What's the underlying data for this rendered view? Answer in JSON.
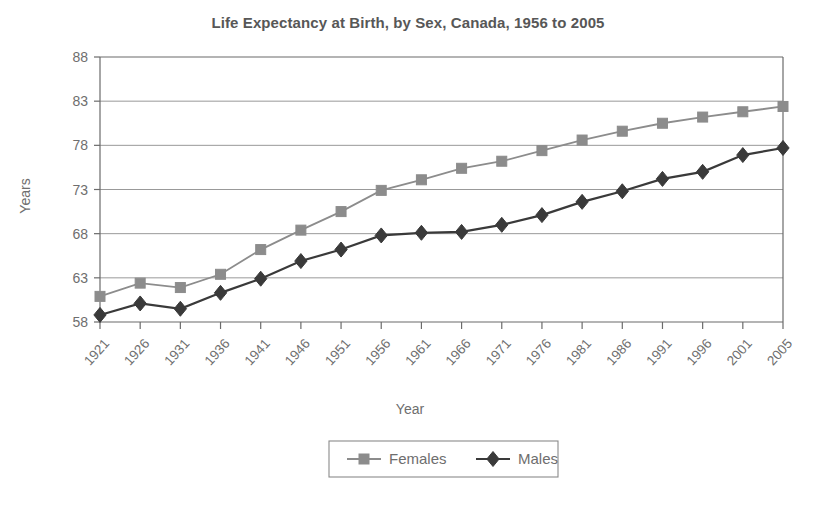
{
  "chart_data": {
    "type": "line",
    "title": "Life Expectancy at Birth, by Sex, Canada, 1956 to 2005",
    "xlabel": "Year",
    "ylabel": "Years",
    "categories": [
      "1921",
      "1926",
      "1931",
      "1936",
      "1941",
      "1946",
      "1951",
      "1956",
      "1961",
      "1966",
      "1971",
      "1976",
      "1981",
      "1986",
      "1991",
      "1996",
      "2001",
      "2005"
    ],
    "yticks": [
      58,
      63,
      68,
      73,
      78,
      83,
      88
    ],
    "ylim": [
      58,
      88
    ],
    "grid": "horizontal",
    "legend_position": "bottom",
    "series": [
      {
        "name": "Females",
        "marker": "square",
        "color": "#8c8c8c",
        "values": [
          60.9,
          62.4,
          61.9,
          63.4,
          66.2,
          68.4,
          70.5,
          72.9,
          74.1,
          75.4,
          76.2,
          77.4,
          78.6,
          79.6,
          80.5,
          81.2,
          81.8,
          82.4
        ]
      },
      {
        "name": "Males",
        "marker": "diamond",
        "color": "#3a3a3a",
        "values": [
          58.8,
          60.1,
          59.5,
          61.3,
          62.9,
          64.9,
          66.2,
          67.8,
          68.1,
          68.2,
          69.0,
          70.1,
          71.6,
          72.8,
          74.2,
          75.0,
          76.9,
          77.7
        ]
      }
    ]
  },
  "colors": {
    "females": "#8c8c8c",
    "males": "#3a3a3a",
    "axis": "#6b6b6b",
    "grid": "#8d8d8d",
    "text": "#6e6e6e",
    "title": "#575757"
  }
}
